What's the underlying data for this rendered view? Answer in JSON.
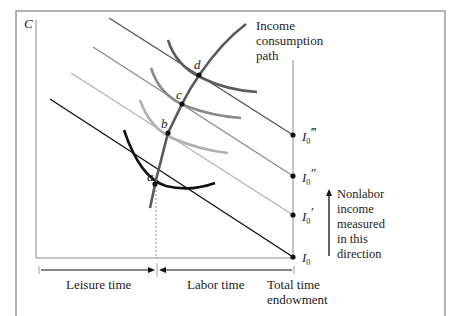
{
  "figure": {
    "y_axis_label": "C",
    "icp_label": [
      "Income",
      "consumption",
      "path"
    ],
    "points": [
      {
        "id": "a",
        "label": "a"
      },
      {
        "id": "b",
        "label": "b"
      },
      {
        "id": "c",
        "label": "c"
      },
      {
        "id": "d",
        "label": "d"
      }
    ],
    "income_labels": [
      {
        "base": "I",
        "sub": "0",
        "prime": ""
      },
      {
        "base": "I",
        "sub": "0",
        "prime": "′"
      },
      {
        "base": "I",
        "sub": "0",
        "prime": "″"
      },
      {
        "base": "I",
        "sub": "0",
        "prime": "‴"
      }
    ],
    "nonlabor_note": [
      "Nonlabor",
      "income",
      "measured",
      "in this",
      "direction"
    ],
    "leisure_label": "Leisure time",
    "labor_label": "Labor time",
    "endowment_label": [
      "Total time",
      "endowment"
    ]
  },
  "colors": {
    "frame": "#9a9a9a",
    "axis": "#8a8a8a",
    "budget_0": "#111111",
    "budget_1": "#b4b4b4",
    "budget_2": "#8c8c8c",
    "budget_3": "#555555",
    "icp": "#5a5a5a",
    "curve_a": "#111111",
    "curve_b": "#b0b0b0",
    "curve_c": "#8a8a8a",
    "curve_d": "#5c5c5c"
  }
}
